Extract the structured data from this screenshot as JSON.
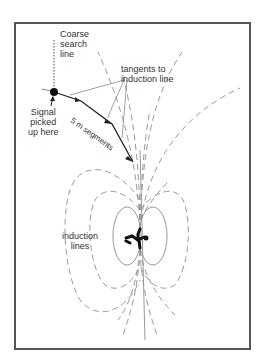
{
  "diagram": {
    "labels": {
      "coarse_search": [
        "Coarse",
        "search",
        "line"
      ],
      "signal": [
        "Signal",
        "picked",
        "up here"
      ],
      "tangents": [
        "tangents to",
        "induction line"
      ],
      "segments": "5 m segments",
      "induction": [
        "induction",
        "lines"
      ]
    },
    "colors": {
      "frame": "#555555",
      "path": "#222222",
      "field_lines": "#999999",
      "label": "#333333"
    }
  }
}
